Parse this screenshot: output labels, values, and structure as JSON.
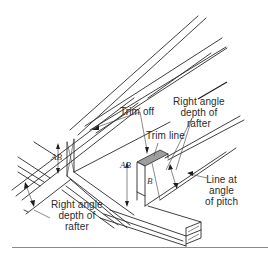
{
  "figure": {
    "labels": {
      "trim_off": "Trim off",
      "right_angle_top": [
        "Right angle",
        "depth of",
        "rafter"
      ],
      "trim_line": "Trim line",
      "right_angle_left": [
        "Right angle",
        "depth of",
        "rafter"
      ],
      "line_at_angle": [
        "Line at",
        "angle",
        "of pitch"
      ]
    },
    "dimensions": {
      "ab_left": "AB",
      "ab_right": "AB",
      "b_mark": "B"
    },
    "colors": {
      "line": "#2a2a2a",
      "shaded_cut": "#9e9e9e",
      "background": "#ffffff",
      "rule": "#8a8a8a"
    }
  }
}
